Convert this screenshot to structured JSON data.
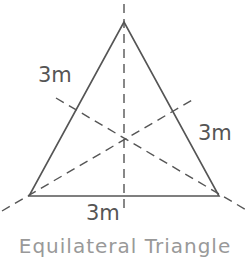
{
  "diagram": {
    "type": "equilateral-triangle-with-lines-of-symmetry",
    "labels": {
      "left_side": "3m",
      "right_side": "3m",
      "bottom_side": "3m"
    },
    "caption": "Equilateral Triangle",
    "colors": {
      "stroke": "#555555",
      "text": "#555555",
      "background": "#ffffff"
    }
  }
}
